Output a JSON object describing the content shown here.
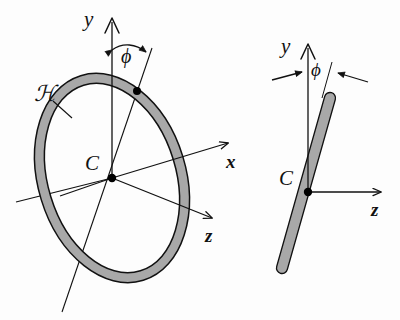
{
  "figure": {
    "background_color": "#fdfdfd",
    "ink_color": "#111111",
    "ring_fill_color": "#a8a8a8",
    "ring_outline_color": "#111111",
    "marker_color": "#000000"
  },
  "left_panel": {
    "name": "perspective-view",
    "hoop_label": "ℋ",
    "center_label": "C",
    "axis_y_label": "y",
    "axis_x_label": "x",
    "axis_z_label": "z",
    "angle_label": "ϕ"
  },
  "right_panel": {
    "name": "edge-on-view",
    "center_label": "C",
    "axis_y_label": "y",
    "axis_z_label": "z",
    "angle_label": "ϕ"
  }
}
